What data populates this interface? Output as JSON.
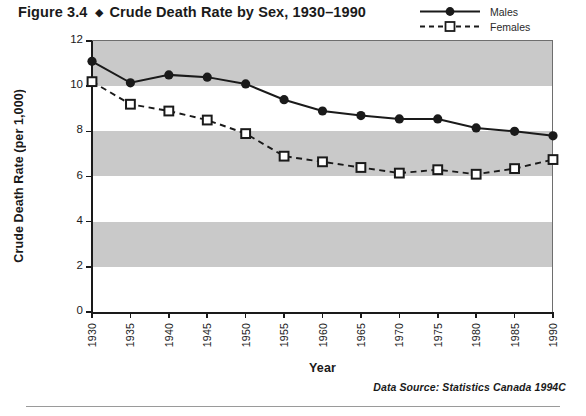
{
  "title": {
    "figure_number": "Figure 3.4",
    "diamond": "◆",
    "text": "Crude Death Rate by Sex, 1930–1990"
  },
  "source_note": "Data Source: Statistics Canada 1994C",
  "legend": {
    "position": "top-right",
    "entries": [
      {
        "label": "Males",
        "marker": "filled-circle",
        "line": "solid",
        "color": "#1a1a1a"
      },
      {
        "label": "Females",
        "marker": "open-square",
        "line": "dashed",
        "color": "#1a1a1a"
      }
    ]
  },
  "style": {
    "band_color": "#c9c9c9",
    "axis_color": "#1a1a1a",
    "plot_background": "#ffffff",
    "banded_ranges": [
      [
        10,
        12
      ],
      [
        6,
        8
      ],
      [
        2,
        4
      ]
    ]
  },
  "chart_data": {
    "type": "line",
    "title": "Crude Death Rate by Sex, 1930–1990",
    "xlabel": "Year",
    "ylabel": "Crude Death Rate (per 1,000)",
    "x": [
      1930,
      1935,
      1940,
      1945,
      1950,
      1955,
      1960,
      1965,
      1970,
      1975,
      1980,
      1985,
      1990
    ],
    "xticklabels": [
      "1930",
      "1935",
      "1940",
      "1945",
      "1950",
      "1955",
      "1960",
      "1965",
      "1970",
      "1975",
      "1980",
      "1985",
      "1990"
    ],
    "yticklabels": [
      "0",
      "2",
      "4",
      "6",
      "8",
      "10",
      "12"
    ],
    "yticks": [
      0,
      2,
      4,
      6,
      8,
      10,
      12
    ],
    "xlim": [
      1930,
      1990
    ],
    "ylim": [
      0,
      12
    ],
    "grid": false,
    "series": [
      {
        "name": "Males",
        "marker": "filled-circle",
        "line": "solid",
        "values": [
          11.1,
          10.15,
          10.5,
          10.4,
          10.1,
          9.4,
          8.9,
          8.7,
          8.55,
          8.55,
          8.15,
          8.0,
          7.8
        ]
      },
      {
        "name": "Females",
        "marker": "open-square",
        "line": "dashed",
        "values": [
          10.2,
          9.2,
          8.9,
          8.5,
          7.9,
          6.9,
          6.65,
          6.4,
          6.15,
          6.3,
          6.1,
          6.35,
          6.75
        ]
      }
    ]
  }
}
